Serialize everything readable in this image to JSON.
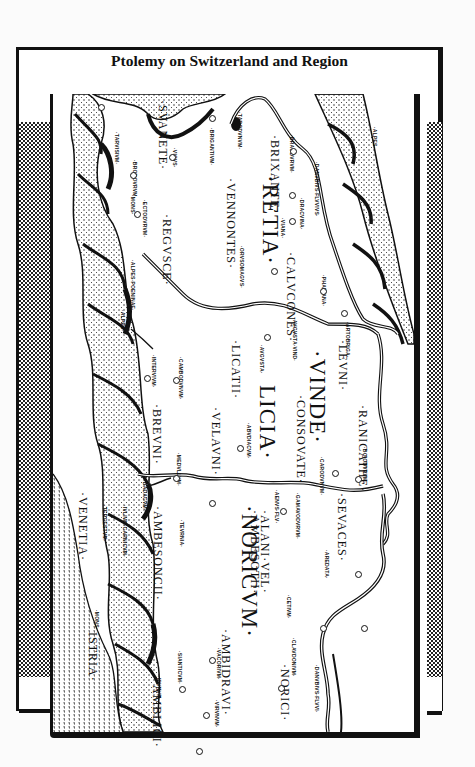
{
  "title": "Ptolemy on Switzerland and Region",
  "map": {
    "orientation": "rotated 90 degrees clockwise",
    "regions": [
      {
        "label": "·RETIA·",
        "size": "big",
        "x": 283,
        "y": 175
      },
      {
        "label": "·VINDE·",
        "size": "big",
        "x": 330,
        "y": 350
      },
      {
        "label": "LICIA·",
        "size": "big",
        "x": 280,
        "y": 385
      },
      {
        "label": "·NORICVM·",
        "size": "big",
        "x": 262,
        "y": 505
      }
    ],
    "peoples": [
      {
        "label": "·SVANETE·",
        "x": 170,
        "y": 100
      },
      {
        "label": "·BRIXANTE·",
        "x": 282,
        "y": 135
      },
      {
        "label": "·VENNONTES·",
        "x": 238,
        "y": 178
      },
      {
        "label": "·REGVSCE·",
        "x": 174,
        "y": 214
      },
      {
        "label": "·CALVCONES·",
        "x": 298,
        "y": 252
      },
      {
        "label": "·LEVNI·",
        "x": 350,
        "y": 340
      },
      {
        "label": "·LICATII·",
        "x": 243,
        "y": 340
      },
      {
        "label": "·CONSOVATE·",
        "x": 308,
        "y": 395
      },
      {
        "label": "·RANICATHE·",
        "x": 370,
        "y": 405
      },
      {
        "label": "·VELAVNI·",
        "x": 223,
        "y": 407
      },
      {
        "label": "·BREVNI·",
        "x": 164,
        "y": 404
      },
      {
        "label": "·SEVACES·",
        "x": 349,
        "y": 493
      },
      {
        "label": "·ALANI·VEL·",
        "x": 272,
        "y": 510
      },
      {
        "label": "·AMBESOTII·",
        "x": 262,
        "y": 510
      },
      {
        "label": "·AMBESONCII·",
        "x": 165,
        "y": 506
      },
      {
        "label": "·NORICI·",
        "x": 292,
        "y": 664
      },
      {
        "label": "·AMBIDRAVI·",
        "x": 233,
        "y": 629
      },
      {
        "label": "·AMBLICI·",
        "x": 164,
        "y": 680
      },
      {
        "label": "ISTRIA·",
        "x": 100,
        "y": 632
      },
      {
        "label": "·VENETIA·",
        "x": 90,
        "y": 492
      }
    ],
    "towns": [
      {
        "label": "·TARVISIVM·",
        "x": 120,
        "y": 132
      },
      {
        "label": "·ECTODVRVM·",
        "x": 148,
        "y": 200
      },
      {
        "label": "·BRODOVRVM·",
        "x": 138,
        "y": 160
      },
      {
        "label": "·VICVS·",
        "x": 178,
        "y": 148
      },
      {
        "label": "·BRIGANTIVM·",
        "x": 215,
        "y": 128
      },
      {
        "label": "·TARODVNVM·",
        "x": 243,
        "y": 112
      },
      {
        "label": "·BRAODVRVM·",
        "x": 295,
        "y": 135
      },
      {
        "label": "·DRACVINA·",
        "x": 305,
        "y": 198
      },
      {
        "label": "·VIANA·",
        "x": 286,
        "y": 218
      },
      {
        "label": "·DANVBIVS·FLVVIVS·",
        "x": 320,
        "y": 162
      },
      {
        "label": "·PHAEIANA·",
        "x": 327,
        "y": 275
      },
      {
        "label": "·ORVSOMAGVS·",
        "x": 245,
        "y": 246
      },
      {
        "label": "·AVGVSTA·VIND·",
        "x": 298,
        "y": 318
      },
      {
        "label": "·ARTOBRIGA·",
        "x": 351,
        "y": 322
      },
      {
        "label": "·AVGVSTA·",
        "x": 265,
        "y": 345
      },
      {
        "label": "·CAMBODVNVM·",
        "x": 184,
        "y": 357
      },
      {
        "label": "·INTERVIVM·",
        "x": 157,
        "y": 355
      },
      {
        "label": "·ABVDIACVM·",
        "x": 252,
        "y": 423
      },
      {
        "label": "·CARODVNVM·",
        "x": 325,
        "y": 457
      },
      {
        "label": "·BOIODVRVM·",
        "x": 368,
        "y": 447
      },
      {
        "label": "·MEDVLLVM·",
        "x": 182,
        "y": 453
      },
      {
        "label": "·AENVS·FLV·",
        "x": 280,
        "y": 490
      },
      {
        "label": "·GAMAVODVRVM·",
        "x": 301,
        "y": 493
      },
      {
        "label": "·TEVRNIA·",
        "x": 185,
        "y": 520
      },
      {
        "label": "·AREDATA·",
        "x": 330,
        "y": 550
      },
      {
        "label": "·CETIVM·",
        "x": 292,
        "y": 595
      },
      {
        "label": "·CLAVDONIVM·",
        "x": 297,
        "y": 638
      },
      {
        "label": "·DANVBIVS·FLVVI·",
        "x": 320,
        "y": 665
      },
      {
        "label": "·VACORIVM·",
        "x": 222,
        "y": 648
      },
      {
        "label": "·SIANTICVM·",
        "x": 183,
        "y": 651
      },
      {
        "label": "·IDVNVM·",
        "x": 162,
        "y": 676
      },
      {
        "label": "·VIRVNVM·",
        "x": 220,
        "y": 700
      },
      {
        "label": "·BADACVM·",
        "x": 148,
        "y": 480
      },
      {
        "label": "·IVLIVM·CARNICVM·",
        "x": 128,
        "y": 505
      },
      {
        "label": "·TERGESTVM·",
        "x": 108,
        "y": 505
      },
      {
        "label": "·ALPES·",
        "x": 378,
        "y": 127
      },
      {
        "label": "·ALPES·POENINAE·",
        "x": 136,
        "y": 260
      },
      {
        "label": "·ALPES·",
        "x": 126,
        "y": 310
      },
      {
        "label": "·MONS·",
        "x": 136,
        "y": 195
      },
      {
        "label": "·MONS·",
        "x": 100,
        "y": 610
      }
    ],
    "town_markers": [
      [
        101,
        107
      ],
      [
        133,
        175
      ],
      [
        137,
        214
      ],
      [
        172,
        157
      ],
      [
        212,
        118
      ],
      [
        293,
        151
      ],
      [
        292,
        195
      ],
      [
        292,
        221
      ],
      [
        274,
        271
      ],
      [
        323,
        291
      ],
      [
        267,
        337
      ],
      [
        344,
        313
      ],
      [
        176,
        380
      ],
      [
        147,
        378
      ],
      [
        240,
        448
      ],
      [
        335,
        473
      ],
      [
        358,
        479
      ],
      [
        176,
        478
      ],
      [
        283,
        511
      ],
      [
        212,
        503
      ],
      [
        358,
        574
      ],
      [
        323,
        628
      ],
      [
        364,
        628
      ],
      [
        281,
        688
      ],
      [
        212,
        660
      ],
      [
        206,
        715
      ],
      [
        182,
        689
      ],
      [
        199,
        751
      ]
    ],
    "colors": {
      "ink": "#111111",
      "paper": "#ffffff",
      "checker": "#222222"
    }
  }
}
